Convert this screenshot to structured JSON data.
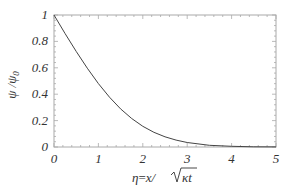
{
  "chart_data": {
    "type": "line",
    "title": "",
    "xlabel": "η = x/√κt",
    "ylabel": "ψ / ψ0",
    "xlim": [
      0,
      5
    ],
    "ylim": [
      0,
      1
    ],
    "x_ticks": [
      "0",
      "1",
      "2",
      "3",
      "4",
      "5"
    ],
    "y_ticks": [
      "0",
      "0.2",
      "0.4",
      "0.6",
      "0.8",
      "1"
    ],
    "grid": false,
    "legend": null,
    "series": [
      {
        "name": "ψ/ψ0",
        "x": [
          0,
          0.25,
          0.5,
          0.75,
          1,
          1.25,
          1.5,
          1.75,
          2,
          2.25,
          2.5,
          2.75,
          3,
          3.5,
          4,
          4.5,
          5
        ],
        "values": [
          1,
          0.859,
          0.724,
          0.597,
          0.48,
          0.377,
          0.289,
          0.216,
          0.157,
          0.111,
          0.077,
          0.052,
          0.034,
          0.013,
          0.005,
          0.0015,
          0.0005
        ]
      }
    ]
  },
  "labels": {
    "xlabel_eta": "η",
    "xlabel_eq": "=",
    "xlabel_x": "x/",
    "xlabel_root": "κt",
    "ylabel": "ψ /ψ",
    "ylabel_sub": "0"
  },
  "colors": {
    "curve": "#444444",
    "frame": "#aaaaaa",
    "text": "#333333"
  }
}
